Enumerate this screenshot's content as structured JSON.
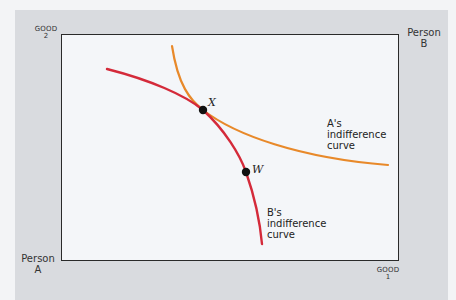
{
  "axes": {
    "good2_label": "GOOD",
    "good2_number": "2",
    "good1_label": "GOOD",
    "good1_number": "1"
  },
  "persons": {
    "a_line1": "Person",
    "a_line2": "A",
    "b_line1": "Person",
    "b_line2": "B"
  },
  "curves": {
    "a_curve": {
      "label_line1": "A's",
      "label_line2": "indifference",
      "label_line3": "curve",
      "color": "#e8892a"
    },
    "b_curve": {
      "label_line1": "B's",
      "label_line2": "indifference",
      "label_line3": "curve",
      "color": "#d42a3a"
    }
  },
  "points": {
    "x_label": "X",
    "w_label": "W",
    "color": "#111111"
  },
  "colors": {
    "panel_bg": "#d9dbdf",
    "plot_bg": "#f4f6f9",
    "border": "#2a2a2a"
  }
}
